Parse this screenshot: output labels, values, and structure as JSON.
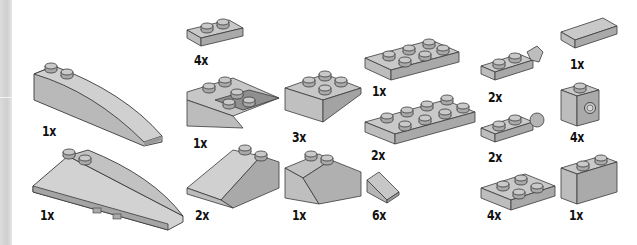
{
  "page": {
    "type": "parts-list",
    "background": "#ffffff"
  },
  "colors": {
    "brick_top": "#c9c9c9",
    "brick_side": "#a9a9a9",
    "brick_front": "#bdbdbd",
    "outline": "#3a3a3a",
    "text": "#111111"
  },
  "parts": [
    {
      "id": "wedge-curved-1x6",
      "qty": "1x"
    },
    {
      "id": "wedge-curved-left",
      "qty": "1x"
    },
    {
      "id": "plate-1x2",
      "qty": "4x"
    },
    {
      "id": "slope-inverted-2x2-hollow",
      "qty": "1x"
    },
    {
      "id": "slope-2x2",
      "qty": "2x"
    },
    {
      "id": "slope-inverted-2x2",
      "qty": "3x"
    },
    {
      "id": "slope-45-double",
      "qty": "1x"
    },
    {
      "id": "plate-2x3",
      "qty": "1x"
    },
    {
      "id": "plate-2x4",
      "qty": "2x"
    },
    {
      "id": "slope-cheese-1x1",
      "qty": "6x"
    },
    {
      "id": "hinge-plate-1x2-fork",
      "qty": "2x"
    },
    {
      "id": "hinge-plate-1x2-finger",
      "qty": "2x"
    },
    {
      "id": "plate-2x2",
      "qty": "4x"
    },
    {
      "id": "tile-1x2",
      "qty": "1x"
    },
    {
      "id": "brick-1x1-stud-side",
      "qty": "4x"
    },
    {
      "id": "brick-1x2",
      "qty": "1x"
    }
  ]
}
